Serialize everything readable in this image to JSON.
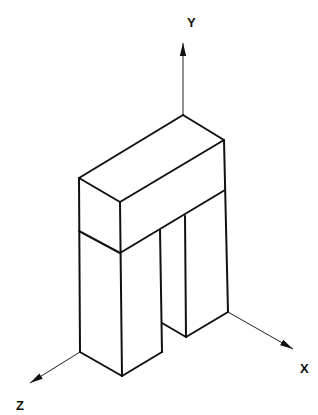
{
  "diagram": {
    "type": "isometric-drawing",
    "colors": {
      "line": "#111111",
      "background": "#ffffff"
    },
    "axes": [
      {
        "name": "y-axis",
        "label": "Y",
        "origin": [
          183,
          115
        ],
        "tip": [
          183,
          43
        ],
        "label_pos": [
          187,
          27
        ]
      },
      {
        "name": "x-axis",
        "label": "X",
        "origin": [
          228,
          312
        ],
        "tip": [
          293,
          349
        ],
        "label_pos": [
          300,
          373
        ]
      },
      {
        "name": "z-axis",
        "label": "Z",
        "origin": [
          80,
          352
        ],
        "tip": [
          30,
          383
        ],
        "label_pos": [
          16,
          410
        ]
      }
    ],
    "edges": [
      [
        [
          79,
          178
        ],
        [
          183,
          115
        ]
      ],
      [
        [
          183,
          115
        ],
        [
          224,
          140
        ]
      ],
      [
        [
          79,
          178
        ],
        [
          120,
          202
        ]
      ],
      [
        [
          120,
          202
        ],
        [
          224,
          140
        ]
      ],
      [
        [
          79,
          178
        ],
        [
          80,
          352
        ]
      ],
      [
        [
          120,
          202
        ],
        [
          122,
          376
        ]
      ],
      [
        [
          224,
          140
        ],
        [
          228,
          312
        ]
      ],
      [
        [
          79,
          231
        ],
        [
          120,
          253
        ]
      ],
      [
        [
          120,
          253
        ],
        [
          225,
          190
        ]
      ],
      [
        [
          80,
          352
        ],
        [
          122,
          376
        ]
      ],
      [
        [
          122,
          376
        ],
        [
          162,
          352
        ]
      ],
      [
        [
          160,
          230
        ],
        [
          162,
          352
        ]
      ],
      [
        [
          162,
          323
        ],
        [
          186,
          337
        ]
      ],
      [
        [
          185,
          216
        ],
        [
          186,
          337
        ]
      ],
      [
        [
          186,
          337
        ],
        [
          228,
          312
        ]
      ]
    ]
  }
}
